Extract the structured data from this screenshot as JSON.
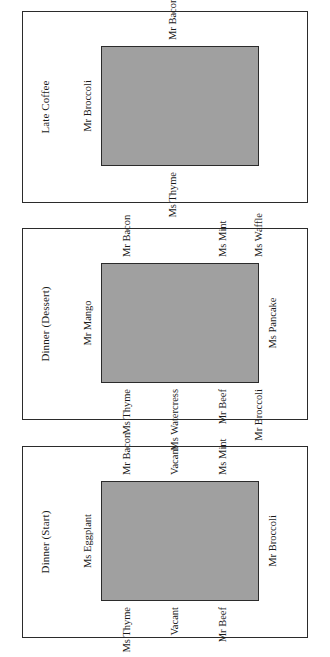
{
  "figure": {
    "orientation": "landscape-rotated-90ccw",
    "background_color": "#ffffff",
    "table_fill_color": "#a0a0a0",
    "border_color": "#2b2b2b",
    "panel_count": 3
  },
  "panels": [
    {
      "title": "Dinner (Start)",
      "table": {
        "x": 36,
        "y": 78,
        "w": 120,
        "h": 158
      },
      "seats": [
        {
          "label": "Ms Eggplant",
          "side": "top",
          "x": 96,
          "y": 70
        },
        {
          "label": "Ms Thyme",
          "side": "left",
          "x": 30,
          "y": 104
        },
        {
          "label": "Mr Bacon",
          "side": "right",
          "x": 162,
          "y": 104
        },
        {
          "label": "Vacant",
          "side": "left",
          "x": 30,
          "y": 152
        },
        {
          "label": "Vacant",
          "side": "right",
          "x": 162,
          "y": 152
        },
        {
          "label": "Mr Beef",
          "side": "left",
          "x": 30,
          "y": 200
        },
        {
          "label": "Ms Mint",
          "side": "right",
          "x": 162,
          "y": 200
        },
        {
          "label": "Mr Broccoli",
          "side": "bottom",
          "x": 96,
          "y": 244
        }
      ]
    },
    {
      "title": "Dinner (Dessert)",
      "table": {
        "x": 36,
        "y": 78,
        "w": 120,
        "h": 158
      },
      "seats": [
        {
          "label": "Mr Mango",
          "side": "top",
          "x": 96,
          "y": 70
        },
        {
          "label": "Ms Thyme",
          "side": "left",
          "x": 30,
          "y": 104
        },
        {
          "label": "Mr Bacon",
          "side": "right",
          "x": 162,
          "y": 104
        },
        {
          "label": "Ms Watercress",
          "side": "left",
          "x": 30,
          "y": 152
        },
        {
          "label": "Mr Beef",
          "side": "left",
          "x": 30,
          "y": 200
        },
        {
          "label": "Ms Mint",
          "side": "right",
          "x": 162,
          "y": 200
        },
        {
          "label": "Mr Broccoli",
          "side": "left",
          "x": 30,
          "y": 236
        },
        {
          "label": "Ms Pancake",
          "side": "bottom",
          "x": 96,
          "y": 244
        },
        {
          "label": "Ms Waffle",
          "side": "right",
          "x": 162,
          "y": 236
        }
      ]
    },
    {
      "title": "Late Coffee",
      "table": {
        "x": 36,
        "y": 78,
        "w": 120,
        "h": 158
      },
      "seats": [
        {
          "label": "Mr Broccoli",
          "side": "top",
          "x": 96,
          "y": 70
        },
        {
          "label": "Ms Thyme",
          "side": "left",
          "x": 30,
          "y": 150
        },
        {
          "label": "Mr Bacon",
          "side": "right",
          "x": 162,
          "y": 150
        }
      ]
    }
  ]
}
